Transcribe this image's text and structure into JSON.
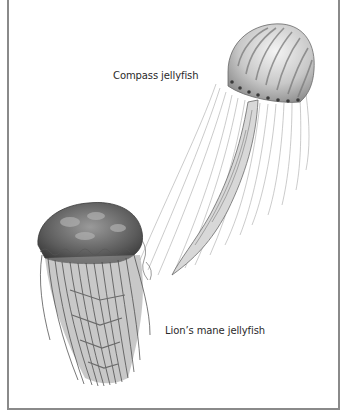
{
  "figure": {
    "labels": {
      "compass": "Compass jellyfish",
      "lions_mane": "Lion’s mane jellyfish"
    },
    "colors": {
      "frame": "#8a8a8a",
      "background": "#ffffff",
      "ink": "#2a2a2a"
    }
  }
}
